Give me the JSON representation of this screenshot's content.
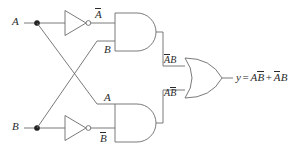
{
  "diagram": {
    "type": "logic-circuit",
    "stroke_color": "#6b6b6b",
    "text_color": "#2b2b2b",
    "background": "#ffffff",
    "inputs": [
      {
        "label": "A",
        "name": "input-a"
      },
      {
        "label": "B",
        "name": "input-b"
      }
    ],
    "inverter_outputs": [
      {
        "base": "A",
        "label": "A-bar",
        "name": "signal-a-bar"
      },
      {
        "base": "B",
        "label": "B-bar",
        "name": "signal-b-bar"
      }
    ],
    "and_gate_top": {
      "name": "and-gate-top",
      "input_top": "A",
      "input_top_bar": true,
      "input_bottom": "B",
      "input_bottom_bar": false,
      "output_label_first": "A",
      "output_label_first_bar": true,
      "output_label_second": "B",
      "output_label_second_bar": false
    },
    "and_gate_bottom": {
      "name": "and-gate-bottom",
      "input_top": "A",
      "input_top_bar": false,
      "input_bottom": "B",
      "input_bottom_bar": true,
      "output_label_first": "A",
      "output_label_first_bar": false,
      "output_label_second": "B",
      "output_label_second_bar": true
    },
    "or_gate": {
      "name": "or-gate"
    },
    "output": {
      "var": "y",
      "equals": "=",
      "term1_a": "A",
      "term1_b": "B",
      "plus": "+",
      "term2_a": "A",
      "term2_b": "B",
      "full_text": "y = AB̄ + ĀB"
    }
  }
}
